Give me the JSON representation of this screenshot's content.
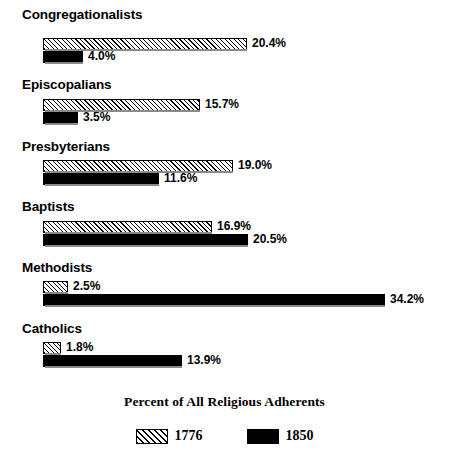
{
  "chart_data": {
    "type": "bar",
    "orientation": "horizontal",
    "title": "Percent of All Religious Adherents",
    "xlabel": "",
    "ylabel": "",
    "grid": false,
    "legend_position": "bottom-center",
    "xlim": [
      0,
      34.2
    ],
    "value_suffix": "%",
    "categories": [
      "Congregationalists",
      "Episcopalians",
      "Presbyterians",
      "Baptists",
      "Methodists",
      "Catholics"
    ],
    "series": [
      {
        "name": "1776",
        "fill": "diagonal-hatch",
        "color": "#ffffff",
        "values": [
          20.4,
          15.7,
          19.0,
          16.9,
          2.5,
          1.8
        ],
        "labels": [
          "20.4%",
          "15.7%",
          "19.0%",
          "16.9%",
          "2.5%",
          "1.8%"
        ]
      },
      {
        "name": "1850",
        "fill": "solid",
        "color": "#000000",
        "values": [
          4.0,
          3.5,
          11.6,
          20.5,
          34.2,
          13.9
        ],
        "labels": [
          "4.0%",
          "3.5%",
          "11.6%",
          "20.5%",
          "34.2%",
          "13.9%"
        ]
      }
    ]
  },
  "legend": {
    "items": [
      {
        "label": "1776",
        "swatch": "hatch"
      },
      {
        "label": "1850",
        "swatch": "solid"
      }
    ]
  },
  "groups": [
    {
      "label": "Congregationalists",
      "label_top": 8,
      "row_top": 38,
      "bar1": {
        "value": 20.4,
        "label": "20.4%"
      },
      "bar2": {
        "value": 4.0,
        "label": "4.0%"
      }
    },
    {
      "label": "Episcopalians",
      "label_top": 78,
      "row_top": 99,
      "bar1": {
        "value": 15.7,
        "label": "15.7%"
      },
      "bar2": {
        "value": 3.5,
        "label": "3.5%"
      }
    },
    {
      "label": "Presbyterians",
      "label_top": 140,
      "row_top": 160,
      "bar1": {
        "value": 19.0,
        "label": "19.0%"
      },
      "bar2": {
        "value": 11.6,
        "label": "11.6%"
      }
    },
    {
      "label": "Baptists",
      "label_top": 200,
      "row_top": 221,
      "bar1": {
        "value": 16.9,
        "label": "16.9%"
      },
      "bar2": {
        "value": 20.5,
        "label": "20.5%"
      }
    },
    {
      "label": "Methodists",
      "label_top": 261,
      "row_top": 281,
      "bar1": {
        "value": 2.5,
        "label": "2.5%"
      },
      "bar2": {
        "value": 34.2,
        "label": "34.2%"
      }
    },
    {
      "label": "Catholics",
      "label_top": 322,
      "row_top": 342,
      "bar1": {
        "value": 1.8,
        "label": "1.8%"
      },
      "bar2": {
        "value": 13.9,
        "label": "13.9%"
      }
    }
  ],
  "scale": {
    "origin_x": 43,
    "px_per_percent": 10.0,
    "bar_height": 12
  }
}
